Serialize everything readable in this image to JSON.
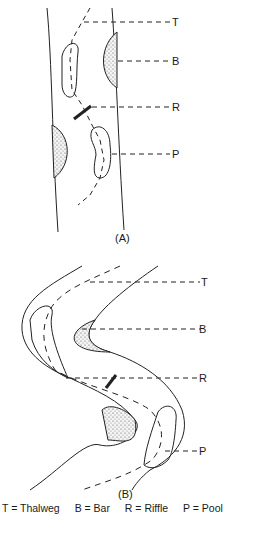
{
  "figure": {
    "panel_a": {
      "caption": "(A)",
      "labels": {
        "T": "T",
        "B": "B",
        "R": "R",
        "P": "P"
      }
    },
    "panel_b": {
      "caption": "(B)",
      "labels": {
        "T": "T",
        "B": "B",
        "R": "R",
        "P": "P"
      }
    },
    "legend": {
      "items": [
        "T  =  Thalweg",
        "B  =  Bar",
        "R = Riffle",
        "P = Pool"
      ]
    },
    "cut_off_text": "…"
  }
}
